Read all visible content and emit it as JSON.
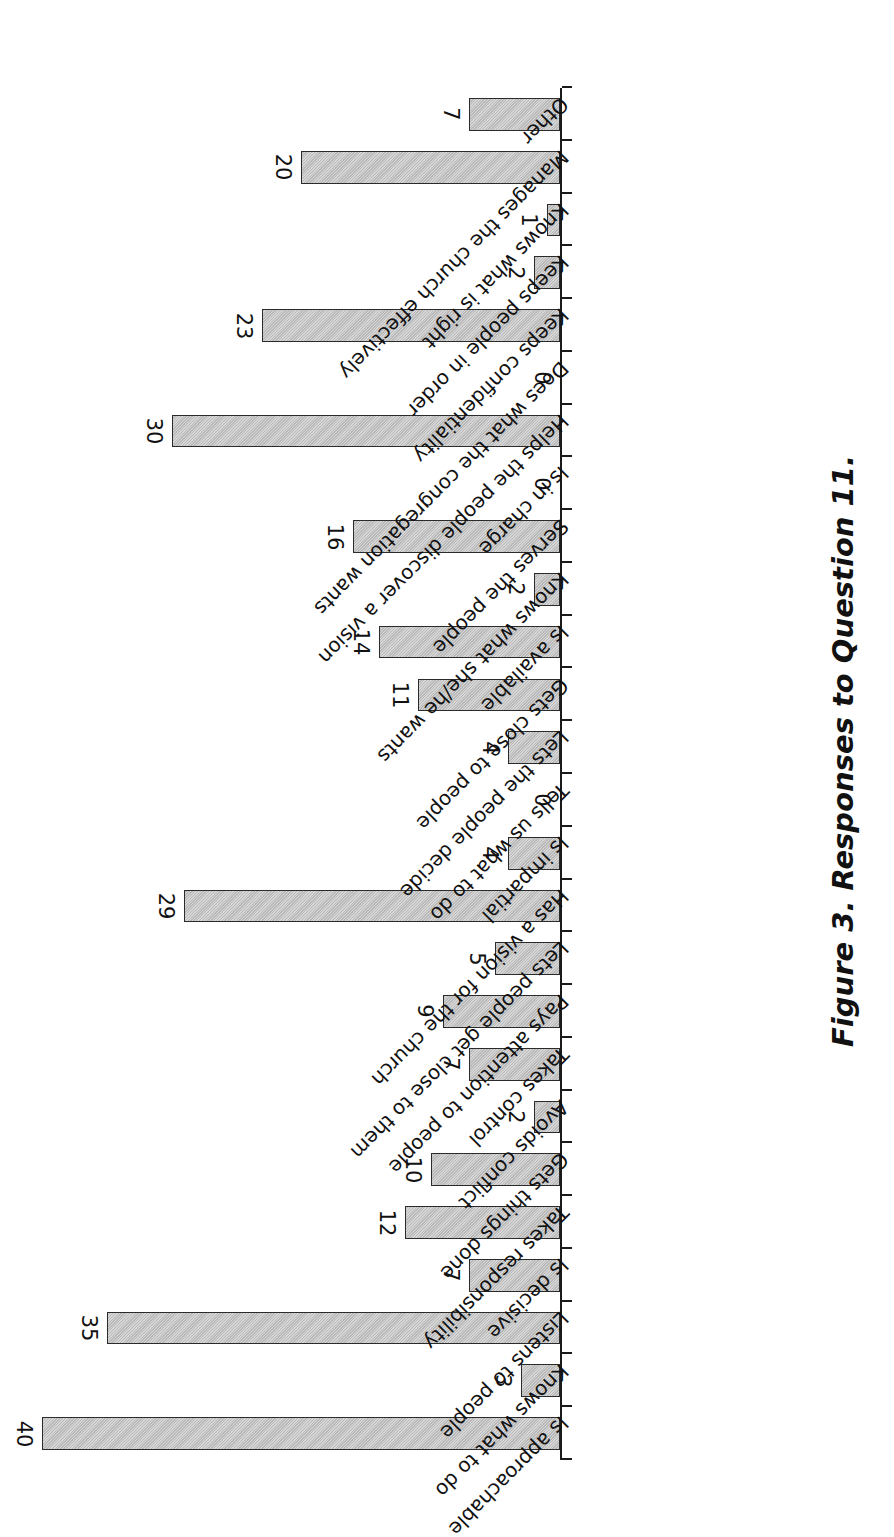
{
  "figure": {
    "caption": "Figure 3. Responses to Question 11."
  },
  "chart_data": {
    "type": "bar",
    "title": "Figure 3. Responses to Question 11.",
    "xlabel": "",
    "ylabel": "",
    "ylim": [
      0,
      40
    ],
    "grid": false,
    "legend": "none",
    "orientation": "vertical-rotated",
    "bar_color": "#c6c6c6",
    "bar_edge_color": "#2b2b2b",
    "categories": [
      "Is approachable",
      "Knows what to do",
      "Listens to people",
      "Is decisive",
      "Takes responsibility",
      "Gets things done",
      "Avoids conflict",
      "Takes control",
      "Pays attention to people",
      "Lets people get close to them",
      "Has a vision for the church",
      "Is impartial",
      "Tells us what to do",
      "Lets the people decide",
      "Gets close to people",
      "Is available",
      "Knows what she/he wants",
      "Serves the people",
      "Is in charge",
      "Helps the people discover a vision",
      "Does what the congregation wants",
      "Keeps confidentiality",
      "Keeps people in order",
      "Knows what is right",
      "Manages the church effectively",
      "Other"
    ],
    "values": [
      40,
      3,
      35,
      7,
      12,
      10,
      2,
      7,
      9,
      5,
      29,
      4,
      0,
      4,
      11,
      14,
      2,
      16,
      0,
      30,
      0,
      23,
      2,
      1,
      20,
      7
    ],
    "value_labels": [
      "40",
      "3",
      "35",
      "7",
      "12",
      "10",
      "2",
      "7",
      "9",
      "5",
      "29",
      "4",
      "0",
      "4",
      "11",
      "14",
      "2",
      "16",
      "0",
      "30",
      "0",
      "23",
      "2",
      "1",
      "20",
      "7"
    ]
  }
}
